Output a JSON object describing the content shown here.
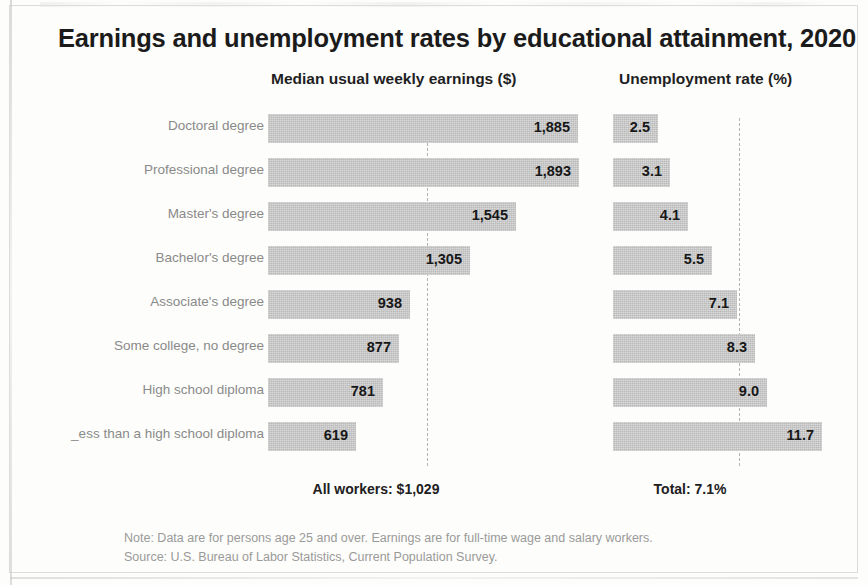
{
  "title": "Earnings and unemployment rates by educational attainment, 2020",
  "headers": {
    "earnings": "Median usual weekly earnings ($)",
    "unemployment": "Unemployment rate (%)"
  },
  "totals": {
    "earnings": "All workers: $1,029",
    "unemployment": "Total: 7.1%"
  },
  "notes": {
    "note": "Note: Data are for persons age 25 and over. Earnings are for full-time wage and salary workers.",
    "source": "Source: U.S. Bureau of Labor Statistics, Current Population Survey."
  },
  "chart_data": {
    "type": "bar",
    "title": "Earnings and unemployment rates by educational attainment, 2020",
    "orientation": "horizontal",
    "grid": false,
    "legend": "none",
    "categories": [
      "Doctoral degree",
      "Professional degree",
      "Master's degree",
      "Bachelor's degree",
      "Associate's degree",
      "Some college, no degree",
      "High school diploma",
      "Less than a high school diploma"
    ],
    "category_labels_displayed": [
      "Doctoral degree",
      "Professional degree",
      "Master's degree",
      "Bachelor's degree",
      "Associate's degree",
      "Some college, no degree",
      "High school diploma",
      "_ess than a high school diploma"
    ],
    "series": [
      {
        "name": "Median usual weekly earnings ($)",
        "unit": "$",
        "values": [
          1885,
          1893,
          1545,
          1305,
          938,
          877,
          781,
          619
        ],
        "labels": [
          "1,885",
          "1,893",
          "1,545",
          "1,305",
          "938",
          "877",
          "781",
          "619"
        ],
        "reference_line": {
          "label": "All workers: $1,029",
          "value": 1029
        },
        "xlim": [
          0,
          2000
        ]
      },
      {
        "name": "Unemployment rate (%)",
        "unit": "%",
        "values": [
          2.5,
          3.1,
          4.1,
          5.5,
          7.1,
          8.3,
          9.0,
          11.7
        ],
        "labels": [
          "2.5",
          "3.1",
          "4.1",
          "5.5",
          "7.1",
          "8.3",
          "9.0",
          "11.7"
        ],
        "reference_line": {
          "label": "Total: 7.1%",
          "value": 7.1
        },
        "xlim": [
          0,
          12.5
        ]
      }
    ],
    "bar_color": "#c9c9c9",
    "reference_line_color": "#b4b4b2",
    "notes": [
      "Note: Data are for persons age 25 and over. Earnings are for full-time wage and salary workers.",
      "Source: U.S. Bureau of Labor Statistics, Current Population Survey."
    ]
  },
  "geometry": {
    "earnings_bar_px": [
      310,
      311,
      248,
      202,
      142,
      131,
      115,
      88
    ],
    "unemp_bar_px": [
      45,
      57,
      75,
      99,
      124,
      142,
      154,
      209
    ]
  }
}
